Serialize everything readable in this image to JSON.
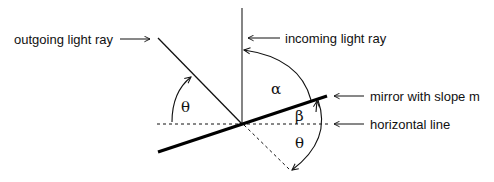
{
  "labels": {
    "outgoing": "outgoing light ray",
    "incoming": "incoming light ray",
    "mirror": "mirror with slope m",
    "horizontal": "horizontal line"
  },
  "angles": {
    "theta_left": "θ",
    "alpha": "α",
    "beta": "β",
    "theta_right": "θ"
  },
  "colors": {
    "stroke": "#111111",
    "background": "#ffffff"
  }
}
